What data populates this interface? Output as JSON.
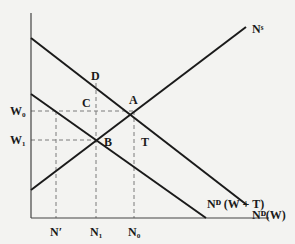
{
  "diagram": {
    "type": "labor-market-tax-wedge",
    "colors": {
      "background": "#f3f3f1",
      "line": "#1a1a1a",
      "dashed": "#777777"
    },
    "axes": {
      "y": {
        "x": 31,
        "top": 13,
        "bottom": 218
      },
      "x": {
        "y": 218,
        "left": 31,
        "right": 269
      }
    },
    "curves": [
      {
        "id": "supply",
        "label": "N",
        "sup": "S",
        "x1": 31,
        "y1": 190,
        "x2": 246,
        "y2": 27,
        "label_x": 252,
        "label_y": 32
      },
      {
        "id": "demand-w",
        "label": "N",
        "sup": "D",
        "suffix": "(W)",
        "x1": 31,
        "y1": 38,
        "x2": 247,
        "y2": 205,
        "label_x": 253,
        "label_y": 218
      },
      {
        "id": "demand-w-plus-t",
        "label": "N",
        "sup": "D",
        "suffix": " (W + T)",
        "x1": 31,
        "y1": 94,
        "x2": 206,
        "y2": 218,
        "label_x": 208,
        "label_y": 207
      }
    ],
    "points": [
      {
        "name": "A",
        "x": 134,
        "y": 111,
        "label_x": 128,
        "label_y": 104
      },
      {
        "name": "B",
        "x": 96,
        "y": 140,
        "label_x": 103,
        "label_y": 145
      },
      {
        "name": "C",
        "x": 96,
        "y": 111,
        "label_x": 82,
        "label_y": 106
      },
      {
        "name": "D",
        "x": 96,
        "y": 83,
        "label_x": 91,
        "label_y": 80
      },
      {
        "name": "T",
        "x": 140,
        "y": 140,
        "label_x": 140,
        "label_y": 145
      }
    ],
    "y_ticks": [
      {
        "label": "W",
        "sub": "0",
        "y": 111
      },
      {
        "label": "W",
        "sub": "1",
        "y": 140
      }
    ],
    "x_ticks": [
      {
        "label": "N′",
        "sub": "",
        "x": 56
      },
      {
        "label": "N",
        "sub": "1",
        "x": 96
      },
      {
        "label": "N",
        "sub": "0",
        "x": 134
      }
    ],
    "labels": {
      "supply": "Nˢ",
      "demand_w": "Nᴰ(W)",
      "demand_wt": "Nᴰ (W + T)",
      "A": "A",
      "B": "B",
      "C": "C",
      "D": "D",
      "T": "T",
      "W0": "W₀",
      "W1": "W₁",
      "Nprime": "N′",
      "N1": "N₁",
      "N0": "N₀"
    }
  }
}
